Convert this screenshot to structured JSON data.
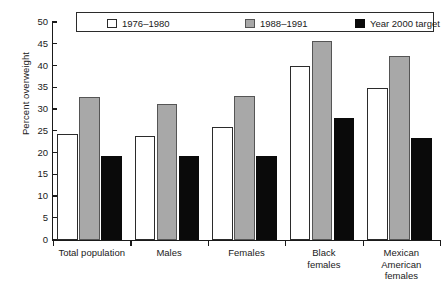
{
  "chart_data": {
    "type": "bar",
    "title": "",
    "xlabel": "",
    "ylabel": "Percent overweight",
    "ylim": [
      0,
      50
    ],
    "ytick_step": 5,
    "yticks": [
      "0",
      "5",
      "10",
      "15",
      "20",
      "25",
      "30",
      "35",
      "40",
      "45",
      "50"
    ],
    "grid": false,
    "legend_position": "top-inside-box",
    "categories": [
      "Total population",
      "Males",
      "Females",
      "Black\nfemales",
      "Mexican\nAmerican\nfemales"
    ],
    "category_lines": [
      [
        "Total population"
      ],
      [
        "Males"
      ],
      [
        "Females"
      ],
      [
        "Black",
        "females"
      ],
      [
        "Mexican",
        "American",
        "females"
      ]
    ],
    "series": [
      {
        "name": "1976–1980",
        "color": "#ffffff",
        "values": [
          24.3,
          23.8,
          26.0,
          40.0,
          35.0
        ]
      },
      {
        "name": "1988–1991",
        "color": "#a8a8a8",
        "values": [
          32.8,
          31.2,
          33.0,
          45.7,
          42.4
        ]
      },
      {
        "name": "Year 2000 target",
        "color": "#0a0a0a",
        "values": [
          19.3,
          19.2,
          19.2,
          28.0,
          23.4
        ]
      }
    ]
  }
}
